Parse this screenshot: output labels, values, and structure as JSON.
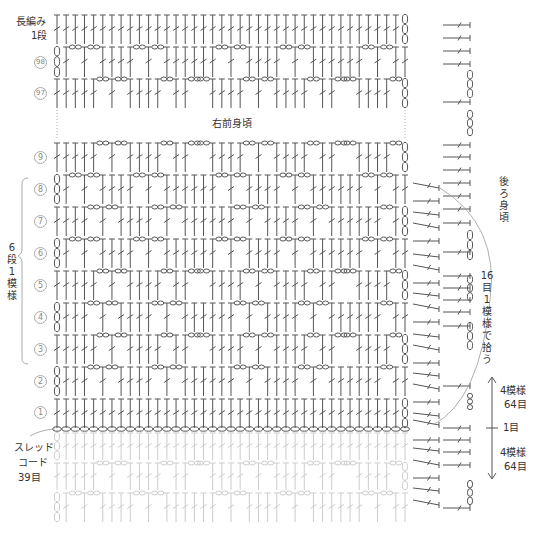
{
  "diagram": {
    "title_top_left": [
      "長編み",
      "1段"
    ],
    "section_label_center": "右前身頃",
    "section_label_right": "後ろ身頃",
    "repeat_label": "6段1模様",
    "pickup_label": "16目1模様で拾う",
    "foundation_label": [
      "スレッド",
      "コード",
      "39目"
    ],
    "measure_top": [
      "4模様",
      "64目"
    ],
    "measure_mid": "1目",
    "measure_bottom": [
      "4模様",
      "64目"
    ],
    "row_numbers": [
      {
        "label": "98",
        "y": 62
      },
      {
        "label": "97",
        "y": 93
      },
      {
        "label": "9",
        "y": 157
      },
      {
        "label": "8",
        "y": 189
      },
      {
        "label": "7",
        "y": 221
      },
      {
        "label": "6",
        "y": 253
      },
      {
        "label": "5",
        "y": 285
      },
      {
        "label": "4",
        "y": 317
      },
      {
        "label": "3",
        "y": 349
      },
      {
        "label": "2",
        "y": 381
      },
      {
        "label": "1",
        "y": 412
      }
    ],
    "stitch_count": 39,
    "colors": {
      "ink": "#555555",
      "faded": "#cccccc",
      "curve": "#999999"
    },
    "rows": [
      {
        "name": "dc-1-row",
        "top": 14,
        "bottom": 44,
        "pattern": "full",
        "turn": "right",
        "faded": false
      },
      {
        "name": "row-98",
        "top": 46,
        "bottom": 77,
        "pattern": "A",
        "turn": "left",
        "faded": false
      },
      {
        "name": "row-97",
        "top": 78,
        "bottom": 108,
        "pattern": "B",
        "turn": "right",
        "faded": false
      },
      {
        "name": "row-9",
        "top": 142,
        "bottom": 172,
        "pattern": "B",
        "turn": "right",
        "faded": false
      },
      {
        "name": "row-8",
        "top": 174,
        "bottom": 204,
        "pattern": "A",
        "turn": "left",
        "faded": false
      },
      {
        "name": "row-7",
        "top": 206,
        "bottom": 236,
        "pattern": "C",
        "turn": "right",
        "faded": false
      },
      {
        "name": "row-6",
        "top": 238,
        "bottom": 268,
        "pattern": "A",
        "turn": "left",
        "faded": false
      },
      {
        "name": "row-5",
        "top": 270,
        "bottom": 300,
        "pattern": "B",
        "turn": "right",
        "faded": false
      },
      {
        "name": "row-4",
        "top": 302,
        "bottom": 332,
        "pattern": "C",
        "turn": "left",
        "faded": false
      },
      {
        "name": "row-3",
        "top": 334,
        "bottom": 364,
        "pattern": "B",
        "turn": "right",
        "faded": false
      },
      {
        "name": "row-2",
        "top": 366,
        "bottom": 396,
        "pattern": "C",
        "turn": "left",
        "faded": false
      },
      {
        "name": "row-1",
        "top": 398,
        "bottom": 428,
        "pattern": "full",
        "turn": "right",
        "faded": false
      },
      {
        "name": "faded-row-1",
        "top": 432,
        "bottom": 460,
        "pattern": "full",
        "turn": "left",
        "faded": true
      },
      {
        "name": "faded-row-2",
        "top": 462,
        "bottom": 490,
        "pattern": "B",
        "turn": "right",
        "faded": true
      },
      {
        "name": "faded-row-3",
        "top": 492,
        "bottom": 522,
        "pattern": "A",
        "turn": "left",
        "faded": true
      }
    ],
    "right_hdc_col1_y": [
      188,
      201,
      215,
      228,
      241,
      257,
      270,
      283,
      296,
      309,
      322,
      337,
      350,
      363,
      376,
      389,
      402,
      416,
      425,
      440,
      451,
      465,
      478,
      491,
      505
    ],
    "right_hdc_col2_y": [
      25,
      38,
      51,
      64,
      102,
      145,
      157,
      170,
      183,
      196,
      209,
      223,
      252,
      276,
      288,
      300,
      312,
      326,
      386,
      428,
      440,
      452,
      465,
      508
    ],
    "right_chain_col2_y": [
      [
        70,
        98
      ],
      [
        110,
        136
      ],
      [
        230,
        260
      ],
      [
        275,
        301
      ],
      [
        322,
        350
      ],
      [
        393,
        410
      ],
      [
        480,
        505
      ]
    ]
  }
}
